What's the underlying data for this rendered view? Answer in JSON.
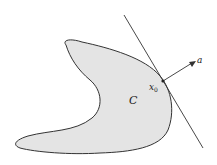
{
  "figure": {
    "labels": {
      "set": "C",
      "point": "x",
      "point_subscript": "0",
      "normal": "a"
    },
    "colors": {
      "set_fill": "#e4e4e4",
      "outline": "#333333",
      "background": "#ffffff"
    }
  }
}
